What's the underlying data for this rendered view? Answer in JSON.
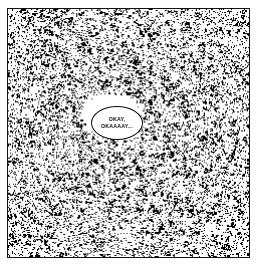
{
  "page": {
    "background_color": "#ffffff",
    "width": 260,
    "height": 271
  },
  "panel": {
    "name": "comic-panel",
    "border_color": "#111111",
    "background_color": "#ffffff",
    "x": 7,
    "y": 8,
    "width": 243,
    "height": 250
  },
  "noise": {
    "description": "dense random black speckle static texture",
    "dot_color": "#000000",
    "background_color": "#ffffff",
    "coverage_percent": 38,
    "seed": 20240613
  },
  "speech_bubble": {
    "shape": "ellipse",
    "outline_color": "#0d0d0d",
    "fill_color": "#ffffff",
    "has_tail": false,
    "center_x": 109,
    "center_y": 114,
    "width": 52,
    "height": 34,
    "lines": [
      "OKAY,",
      "OKAAAAY..."
    ]
  }
}
